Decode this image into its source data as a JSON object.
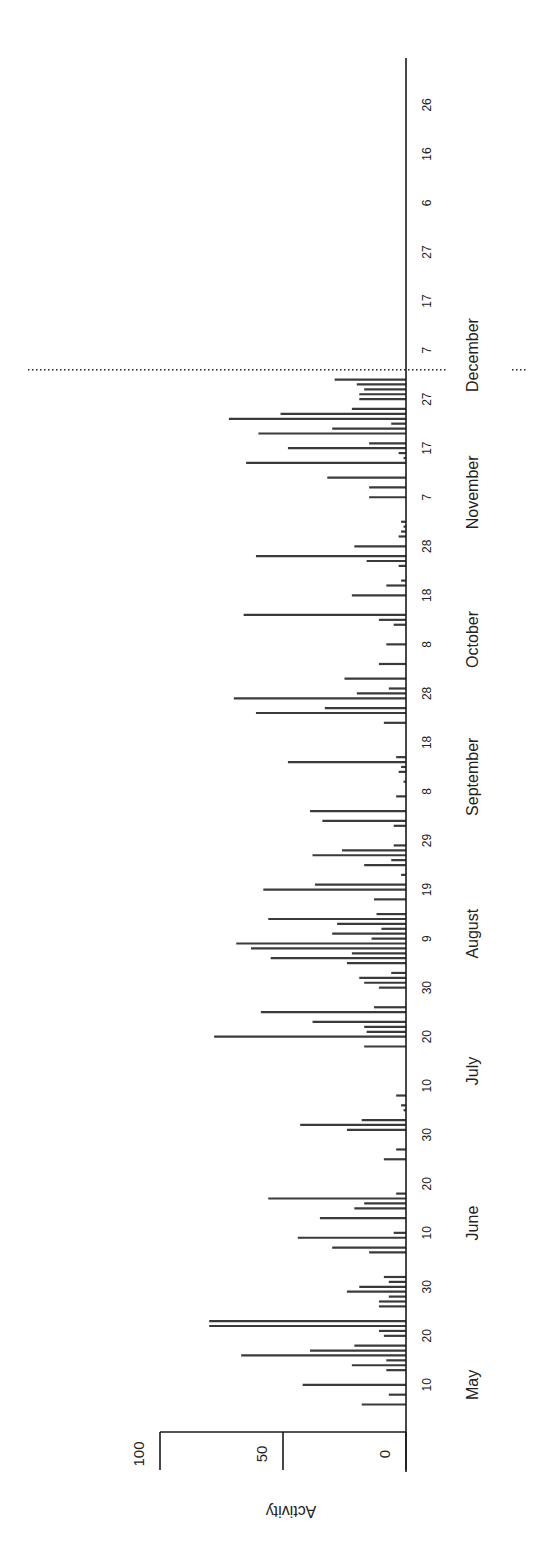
{
  "chart_data": {
    "type": "bar",
    "orientation": "rotated-90-ccw",
    "title": "",
    "xlabel": "",
    "ylabel": "Activity",
    "ylim": [
      0,
      100
    ],
    "yticks": [
      0,
      50,
      100
    ],
    "ytick_labels": [
      "0",
      "50",
      "100"
    ],
    "x_start": "05-01",
    "x_end": "01-31",
    "xticks": [
      {
        "date": "05-10",
        "label": "10"
      },
      {
        "date": "05-20",
        "label": "20"
      },
      {
        "date": "05-30",
        "label": "30"
      },
      {
        "date": "06-10",
        "label": "10"
      },
      {
        "date": "06-20",
        "label": "20"
      },
      {
        "date": "06-30",
        "label": "30"
      },
      {
        "date": "07-10",
        "label": "10"
      },
      {
        "date": "07-20",
        "label": "20"
      },
      {
        "date": "07-30",
        "label": "30"
      },
      {
        "date": "08-09",
        "label": "9"
      },
      {
        "date": "08-19",
        "label": "19"
      },
      {
        "date": "08-29",
        "label": "29"
      },
      {
        "date": "09-08",
        "label": "8"
      },
      {
        "date": "09-18",
        "label": "18"
      },
      {
        "date": "09-28",
        "label": "28"
      },
      {
        "date": "10-08",
        "label": "8"
      },
      {
        "date": "10-18",
        "label": "18"
      },
      {
        "date": "10-28",
        "label": "28"
      },
      {
        "date": "11-07",
        "label": "7"
      },
      {
        "date": "11-17",
        "label": "17"
      },
      {
        "date": "11-27",
        "label": "27"
      },
      {
        "date": "12-07",
        "label": "7"
      },
      {
        "date": "12-17",
        "label": "17"
      },
      {
        "date": "12-27",
        "label": "27"
      },
      {
        "date": "01-06",
        "label": "6"
      },
      {
        "date": "01-16",
        "label": "16"
      },
      {
        "date": "01-26",
        "label": "26"
      }
    ],
    "month_labels": [
      {
        "date": "05-10",
        "label": "May"
      },
      {
        "date": "06-12",
        "label": "June"
      },
      {
        "date": "07-13",
        "label": "July"
      },
      {
        "date": "08-10",
        "label": "August"
      },
      {
        "date": "09-11",
        "label": "September"
      },
      {
        "date": "10-09",
        "label": "October"
      },
      {
        "date": "11-08",
        "label": "November"
      },
      {
        "date": "12-06",
        "label": "December"
      }
    ],
    "reference_line": {
      "date": "12-03",
      "style": "dotted"
    },
    "grid": false,
    "legend": "none",
    "values": [
      {
        "date": "05-06",
        "value": 18
      },
      {
        "date": "05-08",
        "value": 7
      },
      {
        "date": "05-10",
        "value": 42
      },
      {
        "date": "05-13",
        "value": 8
      },
      {
        "date": "05-14",
        "value": 22
      },
      {
        "date": "05-15",
        "value": 8
      },
      {
        "date": "05-16",
        "value": 67
      },
      {
        "date": "05-17",
        "value": 39
      },
      {
        "date": "05-18",
        "value": 21
      },
      {
        "date": "05-20",
        "value": 9
      },
      {
        "date": "05-21",
        "value": 11
      },
      {
        "date": "05-22",
        "value": 80
      },
      {
        "date": "05-23",
        "value": 80
      },
      {
        "date": "05-26",
        "value": 11
      },
      {
        "date": "05-27",
        "value": 11
      },
      {
        "date": "05-28",
        "value": 7
      },
      {
        "date": "05-29",
        "value": 24
      },
      {
        "date": "05-30",
        "value": 19
      },
      {
        "date": "05-31",
        "value": 7
      },
      {
        "date": "06-01",
        "value": 9
      },
      {
        "date": "06-06",
        "value": 15
      },
      {
        "date": "06-07",
        "value": 30
      },
      {
        "date": "06-09",
        "value": 44
      },
      {
        "date": "06-10",
        "value": 5
      },
      {
        "date": "06-13",
        "value": 35
      },
      {
        "date": "06-15",
        "value": 21
      },
      {
        "date": "06-16",
        "value": 17
      },
      {
        "date": "06-17",
        "value": 56
      },
      {
        "date": "06-18",
        "value": 4
      },
      {
        "date": "06-25",
        "value": 9
      },
      {
        "date": "06-27",
        "value": 4
      },
      {
        "date": "07-01",
        "value": 24
      },
      {
        "date": "07-02",
        "value": 43
      },
      {
        "date": "07-03",
        "value": 18
      },
      {
        "date": "07-05",
        "value": 1
      },
      {
        "date": "07-06",
        "value": 2
      },
      {
        "date": "07-08",
        "value": 4
      },
      {
        "date": "07-18",
        "value": 17
      },
      {
        "date": "07-20",
        "value": 78
      },
      {
        "date": "07-21",
        "value": 16
      },
      {
        "date": "07-22",
        "value": 17
      },
      {
        "date": "07-23",
        "value": 38
      },
      {
        "date": "07-25",
        "value": 59
      },
      {
        "date": "07-26",
        "value": 13
      },
      {
        "date": "07-30",
        "value": 11
      },
      {
        "date": "07-31",
        "value": 17
      },
      {
        "date": "08-01",
        "value": 19
      },
      {
        "date": "08-02",
        "value": 6
      },
      {
        "date": "08-04",
        "value": 24
      },
      {
        "date": "08-05",
        "value": 55
      },
      {
        "date": "08-06",
        "value": 22
      },
      {
        "date": "08-07",
        "value": 63
      },
      {
        "date": "08-08",
        "value": 69
      },
      {
        "date": "08-09",
        "value": 14
      },
      {
        "date": "08-10",
        "value": 30
      },
      {
        "date": "08-11",
        "value": 10
      },
      {
        "date": "08-12",
        "value": 28
      },
      {
        "date": "08-13",
        "value": 56
      },
      {
        "date": "08-14",
        "value": 12
      },
      {
        "date": "08-17",
        "value": 13
      },
      {
        "date": "08-19",
        "value": 58
      },
      {
        "date": "08-20",
        "value": 37
      },
      {
        "date": "08-22",
        "value": 2
      },
      {
        "date": "08-24",
        "value": 17
      },
      {
        "date": "08-25",
        "value": 6
      },
      {
        "date": "08-26",
        "value": 38
      },
      {
        "date": "08-27",
        "value": 26
      },
      {
        "date": "08-28",
        "value": 5
      },
      {
        "date": "09-01",
        "value": 5
      },
      {
        "date": "09-02",
        "value": 34
      },
      {
        "date": "09-04",
        "value": 39
      },
      {
        "date": "09-07",
        "value": 4
      },
      {
        "date": "09-10",
        "value": 1
      },
      {
        "date": "09-12",
        "value": 3
      },
      {
        "date": "09-13",
        "value": 2
      },
      {
        "date": "09-14",
        "value": 48
      },
      {
        "date": "09-15",
        "value": 4
      },
      {
        "date": "09-22",
        "value": 9
      },
      {
        "date": "09-24",
        "value": 61
      },
      {
        "date": "09-25",
        "value": 33
      },
      {
        "date": "09-27",
        "value": 70
      },
      {
        "date": "09-28",
        "value": 20
      },
      {
        "date": "09-29",
        "value": 7
      },
      {
        "date": "10-01",
        "value": 25
      },
      {
        "date": "10-04",
        "value": 11
      },
      {
        "date": "10-08",
        "value": 8
      },
      {
        "date": "10-12",
        "value": 5
      },
      {
        "date": "10-13",
        "value": 11
      },
      {
        "date": "10-14",
        "value": 66
      },
      {
        "date": "10-18",
        "value": 22
      },
      {
        "date": "10-20",
        "value": 8
      },
      {
        "date": "10-21",
        "value": 2
      },
      {
        "date": "10-24",
        "value": 3
      },
      {
        "date": "10-25",
        "value": 16
      },
      {
        "date": "10-26",
        "value": 61
      },
      {
        "date": "10-28",
        "value": 21
      },
      {
        "date": "10-30",
        "value": 3
      },
      {
        "date": "10-31",
        "value": 2
      },
      {
        "date": "11-01",
        "value": 1
      },
      {
        "date": "11-02",
        "value": 2
      },
      {
        "date": "11-07",
        "value": 15
      },
      {
        "date": "11-09",
        "value": 15
      },
      {
        "date": "11-11",
        "value": 32
      },
      {
        "date": "11-14",
        "value": 65
      },
      {
        "date": "11-15",
        "value": 1
      },
      {
        "date": "11-16",
        "value": 3
      },
      {
        "date": "11-17",
        "value": 48
      },
      {
        "date": "11-18",
        "value": 15
      },
      {
        "date": "11-20",
        "value": 60
      },
      {
        "date": "11-21",
        "value": 30
      },
      {
        "date": "11-22",
        "value": 6
      },
      {
        "date": "11-23",
        "value": 72
      },
      {
        "date": "11-24",
        "value": 51
      },
      {
        "date": "11-25",
        "value": 22
      },
      {
        "date": "11-27",
        "value": 19
      },
      {
        "date": "11-28",
        "value": 19
      },
      {
        "date": "11-29",
        "value": 17
      },
      {
        "date": "11-30",
        "value": 20
      },
      {
        "date": "12-01",
        "value": 29
      }
    ]
  }
}
